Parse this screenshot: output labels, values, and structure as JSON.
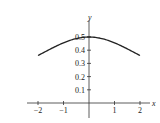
{
  "chart_data": {
    "type": "line",
    "title": "",
    "xlabel": "x",
    "ylabel": "y",
    "xlim": [
      -2.2,
      2.2
    ],
    "ylim": [
      0,
      0.55
    ],
    "grid": false,
    "legend": null,
    "x_ticks": [
      -2,
      -1,
      1,
      2
    ],
    "x_tick_labels": [
      "−2",
      "−1",
      "1",
      "2"
    ],
    "y_ticks": [
      0.1,
      0.2,
      0.3,
      0.4,
      0.5
    ],
    "y_tick_labels": [
      "0.1",
      "0.2",
      "0.3",
      "0.4",
      "0.5"
    ],
    "series": [
      {
        "name": "curve",
        "x": [
          -2,
          -1.5,
          -1,
          -0.5,
          0,
          0.5,
          1,
          1.5,
          2
        ],
        "y": [
          0.36,
          0.42,
          0.465,
          0.49,
          0.5,
          0.49,
          0.465,
          0.42,
          0.36
        ],
        "color": "#222222"
      }
    ]
  }
}
